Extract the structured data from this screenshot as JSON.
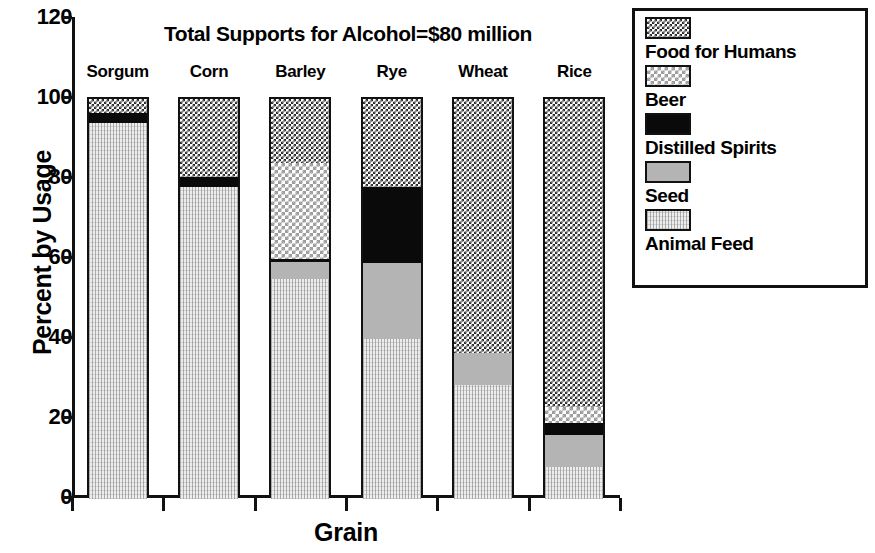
{
  "chart_data": {
    "type": "bar",
    "subtype": "stacked-bar-100",
    "title": "Total Supports for Alcohol=$80 million",
    "xlabel": "Grain",
    "ylabel": "Percent by Usage",
    "ylim": [
      0,
      120
    ],
    "yticks": [
      0,
      20,
      40,
      60,
      80,
      100,
      120
    ],
    "ytick_labels": [
      "0",
      "20",
      "40",
      "60",
      "80",
      "100",
      "120"
    ],
    "grid": false,
    "legend_position": "right",
    "categories": [
      "Sorgum",
      "Corn",
      "Barley",
      "Rye",
      "Wheat",
      "Rice"
    ],
    "series": [
      {
        "name": "Food for Humans",
        "values": [
          3.5,
          19.5,
          16.0,
          22.0,
          63.5,
          77.0
        ]
      },
      {
        "name": "Beer",
        "values": [
          0.0,
          0.0,
          24.0,
          0.0,
          0.0,
          4.0
        ]
      },
      {
        "name": "Distilled Spirits",
        "values": [
          2.5,
          2.5,
          0.8,
          19.0,
          0.0,
          3.0
        ]
      },
      {
        "name": "Seed",
        "values": [
          0.0,
          0.0,
          4.2,
          19.0,
          8.0,
          8.0
        ]
      },
      {
        "name": "Animal Feed",
        "values": [
          94.0,
          78.0,
          55.0,
          40.0,
          28.5,
          8.0
        ]
      }
    ],
    "legend_entries": [
      {
        "label": "Food for Humans",
        "pattern": "dark-checker"
      },
      {
        "label": "Beer",
        "pattern": "light-checker"
      },
      {
        "label": "Distilled Spirits",
        "pattern": "solid-black"
      },
      {
        "label": "Seed",
        "pattern": "mid-grey"
      },
      {
        "label": "Animal Feed",
        "pattern": "light-stipple"
      }
    ],
    "colors": {
      "food_for_humans": "#2b2b2b",
      "beer": "#d4d4d4",
      "distilled_spirits": "#0a0a0a",
      "seed": "#b4b4b4",
      "animal_feed": "#ededed",
      "axis": "#111111",
      "background": "#ffffff"
    }
  }
}
